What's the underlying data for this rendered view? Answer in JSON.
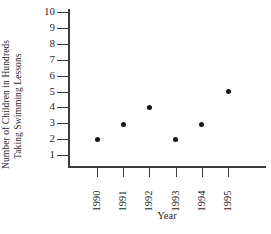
{
  "chart_data": {
    "type": "scatter",
    "title": "",
    "xlabel": "Year",
    "ylabel": "Number of Children in Hundreds Taking Swimming Lessons",
    "ylabel_line1": "Number of Children in Hundreds",
    "ylabel_line2": "Taking Swimming Lessons",
    "categories": [
      "1990",
      "1991",
      "1992",
      "1993",
      "1994",
      "1995"
    ],
    "values": [
      2,
      2.9,
      4,
      2,
      2.9,
      5
    ],
    "x": [
      1990,
      1991,
      1992,
      1993,
      1994,
      1995
    ],
    "ylim": [
      0,
      10
    ],
    "yticks": [
      "10",
      "9",
      "8",
      "7",
      "6",
      "5",
      "4",
      "3",
      "2",
      "1"
    ],
    "ytick_values": [
      10,
      9,
      8,
      7,
      6,
      5,
      4,
      3,
      2,
      1
    ],
    "xticks": [
      "1990",
      "1991",
      "1992",
      "1993",
      "1994",
      "1995"
    ],
    "grid": false,
    "legend": false,
    "series": [
      {
        "name": "Children taking swimming lessons",
        "points": [
          {
            "x": "1990",
            "y": 2
          },
          {
            "x": "1991",
            "y": 2.9
          },
          {
            "x": "1992",
            "y": 4
          },
          {
            "x": "1993",
            "y": 2
          },
          {
            "x": "1994",
            "y": 2.9
          },
          {
            "x": "1995",
            "y": 5
          }
        ]
      }
    ],
    "marker_color": "#141414",
    "axis_color": "#3b3b3b"
  }
}
